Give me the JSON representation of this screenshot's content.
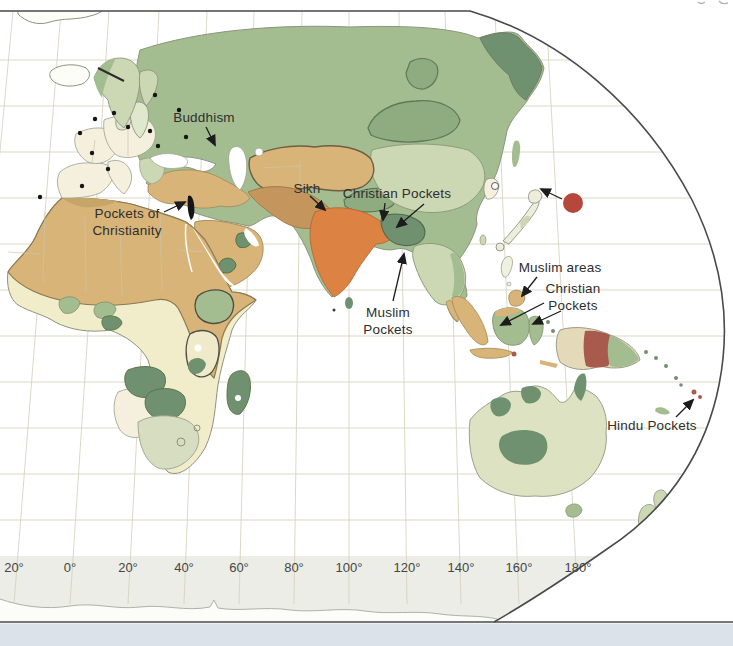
{
  "map": {
    "description": "World religions map, eastern hemisphere view",
    "annotations": [
      {
        "id": "buddhism",
        "label": "Buddhism"
      },
      {
        "id": "sikh",
        "label": "Sikh"
      },
      {
        "id": "christian-pockets-south-asia",
        "label": "Christian Pockets"
      },
      {
        "id": "pockets-of-christianity",
        "lines": [
          "Pockets of",
          "Christianity"
        ]
      },
      {
        "id": "muslim-pockets",
        "lines": [
          "Muslim",
          "Pockets"
        ]
      },
      {
        "id": "muslim-areas",
        "label": "Muslim areas"
      },
      {
        "id": "christian-pockets-indonesia",
        "lines": [
          "Christian",
          "Pockets"
        ]
      },
      {
        "id": "hindu-pockets",
        "label": "Hindu Pockets"
      }
    ],
    "axis": {
      "unit": "degrees longitude",
      "ticks": [
        "20°",
        "0°",
        "20°",
        "40°",
        "60°",
        "80°",
        "100°",
        "120°",
        "140°",
        "160°",
        "180°"
      ]
    },
    "colors": {
      "ocean": "#ffffff",
      "land_pale": "#f1ecca",
      "land_cream": "#f4f0dd",
      "light_green": "#ccd8b4",
      "medium_green": "#a4bd90",
      "buddhist_green": "#8fac80",
      "dark_green": "#6f9170",
      "sunni_tan": "#d9b478",
      "shia_brown": "#c4955c",
      "hindu_orange": "#dc8243",
      "shinto_red": "#b5473c",
      "mixed_maroon": "#a85a4c",
      "judaism_black": "#151515",
      "graticule": "#d8d3c0",
      "border": "#4a4a4a",
      "coast": "#8d937f",
      "antarctic_band": "#ebede6",
      "south_strip": "#dbe2e9",
      "label_text": "#2e2e2e"
    }
  }
}
